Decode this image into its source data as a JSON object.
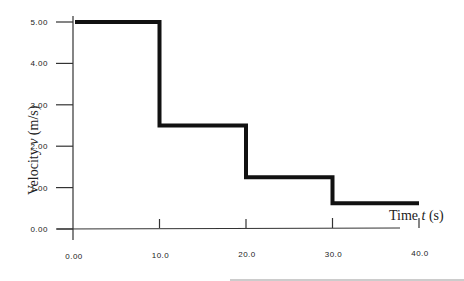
{
  "chart_data": {
    "type": "line",
    "subtype": "step",
    "title": "",
    "xlabel": "Time t (s)",
    "ylabel": "Velocity v (m/s)",
    "xlabel_parts": {
      "pre": "Time ",
      "var": "t",
      "post": " (s)"
    },
    "ylabel_parts": {
      "pre": "Velocity ",
      "var": "v",
      "post": " (m/s)"
    },
    "xlim": [
      0,
      40
    ],
    "ylim": [
      0,
      5
    ],
    "x_ticks": [
      "0.00",
      "10.0",
      "20.0",
      "30.0",
      "40.0"
    ],
    "y_ticks": [
      "0.00",
      "1.00",
      "2.00",
      "3.00",
      "4.00",
      "5.00"
    ],
    "grid": false,
    "legend": null,
    "series": [
      {
        "name": "velocity",
        "color": "#111111",
        "segments": [
          {
            "t_start": 0,
            "t_end": 10,
            "v": 5.0
          },
          {
            "t_start": 10,
            "t_end": 20,
            "v": 2.5
          },
          {
            "t_start": 20,
            "t_end": 30,
            "v": 1.25
          },
          {
            "t_start": 30,
            "t_end": 40,
            "v": 0.625
          }
        ],
        "x": [
          0,
          10,
          10,
          20,
          20,
          30,
          30,
          40
        ],
        "y": [
          5.0,
          5.0,
          2.5,
          2.5,
          1.25,
          1.25,
          0.625,
          0.625
        ]
      }
    ]
  }
}
